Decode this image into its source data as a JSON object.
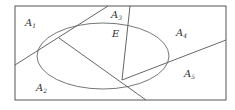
{
  "diagram": {
    "type": "partition-venn",
    "frame": {
      "x": 15,
      "y": 6,
      "width": 211,
      "height": 94
    },
    "ellipse": {
      "cx": 103,
      "cy": 56,
      "rx": 66,
      "ry": 33
    },
    "lines": [
      {
        "x1": 15,
        "y1": 65,
        "x2": 108,
        "y2": 6
      },
      {
        "x1": 59,
        "y1": 38,
        "x2": 146,
        "y2": 100
      },
      {
        "x1": 130,
        "y1": 6,
        "x2": 122,
        "y2": 80
      },
      {
        "x1": 122,
        "y1": 80,
        "x2": 226,
        "y2": 40
      }
    ],
    "labels": [
      {
        "id": "A1",
        "base": "A",
        "sub": "1",
        "x": 25,
        "y": 26
      },
      {
        "id": "A2",
        "base": "A",
        "sub": "2",
        "x": 36,
        "y": 91
      },
      {
        "id": "A3",
        "base": "A",
        "sub": "3",
        "x": 111,
        "y": 18
      },
      {
        "id": "A4",
        "base": "A",
        "sub": "4",
        "x": 176,
        "y": 36
      },
      {
        "id": "A5",
        "base": "A",
        "sub": "5",
        "x": 184,
        "y": 77
      },
      {
        "id": "E",
        "base": "E",
        "sub": "",
        "x": 112,
        "y": 37
      }
    ],
    "stroke_color": "#555555"
  }
}
